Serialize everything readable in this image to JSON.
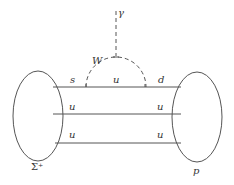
{
  "diagram": {
    "type": "feynman-diagram",
    "process": "Sigma+ -> p + gamma (weak radiative decay)",
    "initial_hadron": "Σ⁺",
    "final_hadron": "p",
    "boson_loop": "W",
    "emitted_particle": "γ",
    "quark_lines": [
      {
        "in": "s",
        "internal": "u",
        "out": "d"
      },
      {
        "in": "u",
        "out": "u"
      },
      {
        "in": "u",
        "out": "u"
      }
    ],
    "colors": {
      "line": "#555555",
      "text": "#333333",
      "background": "#ffffff"
    }
  },
  "labels": {
    "gamma": "γ",
    "w": "W",
    "s": "s",
    "u_internal": "u",
    "d": "d",
    "u_left_mid": "u",
    "u_right_mid": "u",
    "u_left_bot": "u",
    "u_right_bot": "u",
    "sigma": "Σ⁺",
    "proton": "p"
  }
}
